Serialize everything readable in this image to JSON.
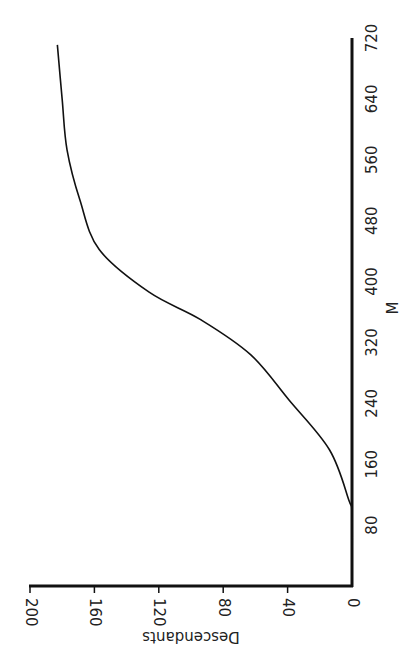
{
  "chart_data": {
    "type": "line",
    "orientation": "rotated-90-clockwise",
    "title": "",
    "xlabel": "M",
    "ylabel": "Descendants",
    "xlim": [
      0,
      720
    ],
    "ylim": [
      0,
      200
    ],
    "x_ticks": [
      80,
      160,
      240,
      320,
      400,
      480,
      560,
      640,
      720
    ],
    "y_ticks": [
      0,
      40,
      80,
      120,
      160,
      200
    ],
    "grid": false,
    "legend": null,
    "series": [
      {
        "name": "Descendants",
        "x": [
          0,
          93,
          113,
          179,
          244,
          304,
          350,
          386,
          442,
          507,
          573,
          639,
          711
        ],
        "y": [
          0,
          0,
          2,
          14,
          39,
          63,
          94,
          126,
          157,
          169,
          177,
          180,
          183
        ]
      }
    ]
  }
}
